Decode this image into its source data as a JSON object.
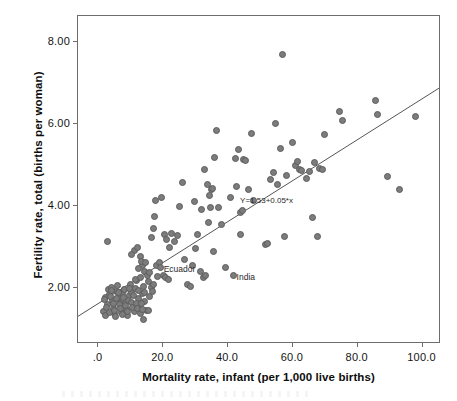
{
  "chart_data": {
    "type": "scatter",
    "title": "",
    "xlabel": "Mortality rate, infant (per 1,000 live births)",
    "ylabel": "Fertility rate, total (births per woman)",
    "xlim": [
      -6,
      106
    ],
    "ylim": [
      0.6,
      8.6
    ],
    "xticks": [
      0,
      20,
      40,
      60,
      80,
      100
    ],
    "xtick_labels": [
      ".0",
      "20.0",
      "40.0",
      "60.0",
      "80.0",
      "100.0"
    ],
    "yticks": [
      2,
      4,
      6,
      8
    ],
    "ytick_labels": [
      "2.00",
      "4.00",
      "6.00",
      "8.00"
    ],
    "grid": false,
    "legend": null,
    "marker": {
      "shape": "circle",
      "fill_color": "#7c7c7c",
      "edge_color": "#5d5d5d",
      "size_px": 7
    },
    "fit_line": {
      "equation_label": "Y=1.53+0.05*x",
      "intercept": 1.53,
      "slope": 0.05,
      "color": "#555555",
      "x_start": -6,
      "x_end": 106,
      "label_x": 44,
      "label_y": 4.08
    },
    "annotations": [
      {
        "text": "Ecuador",
        "x": 19.5,
        "y": 2.46
      },
      {
        "text": "India",
        "x": 42.0,
        "y": 2.26
      }
    ],
    "points": [
      [
        3.0,
        3.1
      ],
      [
        3.4,
        1.92
      ],
      [
        2.6,
        1.74
      ],
      [
        2.0,
        1.4
      ],
      [
        2.4,
        1.3
      ],
      [
        3.2,
        1.56
      ],
      [
        3.8,
        1.8
      ],
      [
        4.2,
        1.98
      ],
      [
        4.6,
        1.66
      ],
      [
        5.0,
        1.46
      ],
      [
        5.4,
        1.34
      ],
      [
        5.8,
        1.88
      ],
      [
        6.2,
        2.02
      ],
      [
        6.6,
        1.72
      ],
      [
        7.0,
        1.58
      ],
      [
        7.4,
        1.38
      ],
      [
        7.8,
        1.82
      ],
      [
        8.2,
        1.94
      ],
      [
        8.6,
        1.62
      ],
      [
        9.0,
        1.44
      ],
      [
        9.4,
        1.3
      ],
      [
        9.8,
        1.78
      ],
      [
        10.2,
        2.06
      ],
      [
        10.6,
        1.86
      ],
      [
        11.0,
        1.52
      ],
      [
        11.4,
        1.4
      ],
      [
        11.8,
        1.96
      ],
      [
        12.2,
        2.14
      ],
      [
        12.6,
        1.7
      ],
      [
        13.0,
        1.48
      ],
      [
        13.4,
        1.34
      ],
      [
        13.8,
        1.84
      ],
      [
        14.2,
        2.0
      ],
      [
        14.6,
        1.64
      ],
      [
        15.0,
        1.42
      ],
      [
        2.2,
        1.68
      ],
      [
        2.8,
        1.5
      ],
      [
        3.6,
        1.36
      ],
      [
        4.0,
        1.76
      ],
      [
        4.4,
        1.9
      ],
      [
        4.8,
        1.6
      ],
      [
        5.2,
        1.42
      ],
      [
        5.6,
        1.28
      ],
      [
        6.0,
        1.7
      ],
      [
        6.4,
        1.86
      ],
      [
        6.8,
        1.56
      ],
      [
        7.2,
        1.46
      ],
      [
        7.6,
        1.32
      ],
      [
        8.0,
        1.74
      ],
      [
        8.4,
        1.92
      ],
      [
        8.8,
        1.54
      ],
      [
        9.2,
        1.4
      ],
      [
        9.6,
        1.66
      ],
      [
        10.0,
        1.96
      ],
      [
        10.4,
        1.62
      ],
      [
        10.8,
        1.5
      ],
      [
        11.2,
        1.78
      ],
      [
        11.6,
        2.18
      ],
      [
        12.0,
        1.58
      ],
      [
        12.4,
        1.46
      ],
      [
        12.8,
        1.9
      ],
      [
        13.2,
        2.22
      ],
      [
        13.6,
        1.6
      ],
      [
        14.0,
        1.44
      ],
      [
        14.4,
        1.86
      ],
      [
        11.5,
        2.88
      ],
      [
        12.3,
        2.96
      ],
      [
        10.4,
        2.78
      ],
      [
        13.2,
        2.74
      ],
      [
        13.9,
        2.52
      ],
      [
        12.8,
        2.44
      ],
      [
        14.6,
        2.38
      ],
      [
        15.4,
        2.28
      ],
      [
        16.2,
        2.34
      ],
      [
        13.5,
        2.62
      ],
      [
        14.9,
        2.58
      ],
      [
        15.8,
        2.12
      ],
      [
        16.6,
        1.98
      ],
      [
        17.4,
        2.04
      ],
      [
        18.2,
        2.52
      ],
      [
        19.0,
        2.6
      ],
      [
        19.5,
        2.46
      ],
      [
        20.3,
        2.26
      ],
      [
        21.1,
        2.22
      ],
      [
        22.0,
        2.18
      ],
      [
        14.2,
        1.2
      ],
      [
        15.6,
        1.42
      ],
      [
        16.0,
        1.76
      ],
      [
        17.0,
        1.88
      ],
      [
        18.6,
        2.24
      ],
      [
        16.8,
        3.2
      ],
      [
        18.0,
        4.1
      ],
      [
        17.2,
        3.42
      ],
      [
        17.6,
        3.72
      ],
      [
        19.8,
        4.18
      ],
      [
        20.6,
        3.28
      ],
      [
        21.4,
        3.16
      ],
      [
        22.2,
        2.96
      ],
      [
        23.0,
        3.3
      ],
      [
        23.8,
        3.1
      ],
      [
        24.6,
        3.24
      ],
      [
        25.4,
        3.96
      ],
      [
        26.2,
        4.54
      ],
      [
        27.0,
        2.66
      ],
      [
        27.8,
        2.06
      ],
      [
        28.6,
        2.0
      ],
      [
        29.4,
        2.52
      ],
      [
        30.2,
        2.94
      ],
      [
        31.0,
        3.28
      ],
      [
        31.8,
        2.36
      ],
      [
        32.6,
        2.22
      ],
      [
        33.4,
        2.26
      ],
      [
        34.2,
        3.56
      ],
      [
        35.0,
        3.92
      ],
      [
        35.8,
        2.86
      ],
      [
        29.8,
        4.08
      ],
      [
        32.0,
        3.88
      ],
      [
        33.0,
        4.86
      ],
      [
        34.0,
        4.48
      ],
      [
        34.6,
        4.22
      ],
      [
        35.2,
        4.38
      ],
      [
        35.6,
        4.4
      ],
      [
        36.2,
        5.14
      ],
      [
        36.8,
        5.8
      ],
      [
        37.4,
        3.92
      ],
      [
        38.2,
        3.52
      ],
      [
        39.6,
        2.46
      ],
      [
        41.0,
        4.18
      ],
      [
        42.0,
        2.26
      ],
      [
        42.6,
        5.12
      ],
      [
        43.4,
        5.34
      ],
      [
        44.2,
        3.8
      ],
      [
        44.8,
        3.86
      ],
      [
        45.2,
        5.1
      ],
      [
        45.8,
        5.08
      ],
      [
        46.6,
        4.38
      ],
      [
        47.4,
        5.74
      ],
      [
        48.2,
        4.1
      ],
      [
        44.0,
        3.28
      ],
      [
        43.0,
        4.44
      ],
      [
        51.8,
        3.02
      ],
      [
        52.6,
        3.06
      ],
      [
        53.4,
        4.62
      ],
      [
        54.2,
        4.78
      ],
      [
        54.8,
        5.98
      ],
      [
        55.6,
        4.5
      ],
      [
        56.4,
        5.38
      ],
      [
        57.0,
        7.65
      ],
      [
        57.6,
        3.22
      ],
      [
        58.4,
        4.72
      ],
      [
        60.2,
        5.52
      ],
      [
        61.0,
        4.96
      ],
      [
        61.6,
        5.04
      ],
      [
        62.2,
        4.86
      ],
      [
        63.0,
        4.84
      ],
      [
        64.6,
        4.64
      ],
      [
        65.4,
        4.8
      ],
      [
        66.2,
        3.68
      ],
      [
        67.0,
        5.02
      ],
      [
        67.8,
        3.22
      ],
      [
        68.6,
        4.88
      ],
      [
        69.4,
        4.86
      ],
      [
        70.2,
        5.7
      ],
      [
        74.8,
        6.28
      ],
      [
        75.6,
        6.06
      ],
      [
        85.8,
        6.54
      ],
      [
        86.4,
        6.2
      ],
      [
        89.6,
        4.68
      ],
      [
        93.2,
        4.36
      ],
      [
        98.2,
        6.16
      ]
    ]
  }
}
